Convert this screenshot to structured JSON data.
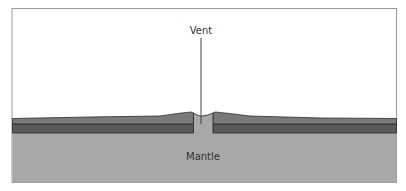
{
  "diagram": {
    "labels": {
      "vent": "Vent",
      "mantle": "Mantle"
    },
    "colors": {
      "background": "#ffffff",
      "frame": "#9a9a9a",
      "upper_layer": "#7a7a7a",
      "lower_layer": "#5a5a5a",
      "layer_outline": "#2a2a2a",
      "mantle": "#a8a8a8",
      "vent_fill": "#a8a8a8",
      "leader_line": "#333333",
      "text": "#333333"
    }
  }
}
